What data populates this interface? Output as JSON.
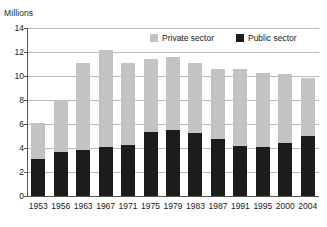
{
  "axis_unit_label": "Millions",
  "legend": {
    "items": [
      {
        "label": "Private sector",
        "color": "#c3c3c3",
        "key": "private"
      },
      {
        "label": "Public sector",
        "color": "#1c1c1c",
        "key": "public"
      }
    ]
  },
  "chart_data": {
    "type": "bar",
    "stacked": true,
    "title": "",
    "subtitle": "",
    "xlabel": "",
    "ylabel": "Millions",
    "ylim": [
      0,
      14
    ],
    "ytick_labels": [
      "0",
      "2",
      "4",
      "6",
      "8",
      "10",
      "12",
      "14"
    ],
    "yticks": [
      0,
      2,
      4,
      6,
      8,
      10,
      12,
      14
    ],
    "grid": "horizontal",
    "legend_position": "top-center",
    "categories": [
      "1953",
      "1956",
      "1963",
      "1967",
      "1971",
      "1975",
      "1979",
      "1983",
      "1987",
      "1991",
      "1995",
      "2000",
      "2004"
    ],
    "series": [
      {
        "name": "Public sector",
        "color": "#1c1c1c",
        "values": [
          3.1,
          3.65,
          3.85,
          4.1,
          4.25,
          5.35,
          5.5,
          5.25,
          4.75,
          4.15,
          4.05,
          4.45,
          5.0
        ]
      },
      {
        "name": "Private sector",
        "color": "#c3c3c3",
        "values": [
          3.0,
          4.35,
          7.2,
          8.05,
          6.85,
          6.05,
          6.05,
          5.8,
          5.8,
          6.45,
          6.2,
          5.7,
          4.8
        ]
      }
    ],
    "totals": [
      6.1,
      8.0,
      11.05,
      12.15,
      11.1,
      11.4,
      11.55,
      11.05,
      10.55,
      10.6,
      10.25,
      10.15,
      9.8
    ]
  }
}
